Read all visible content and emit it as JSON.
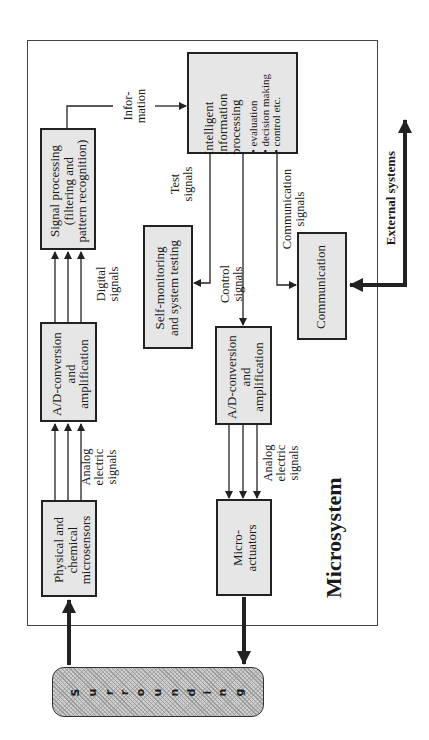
{
  "diagram": {
    "title": "Microsystem",
    "surrounding_label": "Surrounding",
    "surrounding_letters": [
      "S",
      "u",
      "r",
      "r",
      "o",
      "u",
      "n",
      "d",
      "i",
      "n",
      "g"
    ],
    "external_label": "External systems",
    "boxes": {
      "sensors": {
        "lines": [
          "Physical and",
          "chemical",
          "microsensors"
        ]
      },
      "ad_in": {
        "lines": [
          "A/D-conversion",
          "and",
          "amplification"
        ]
      },
      "signal_processing": {
        "lines": [
          "Signal processing",
          "(filtering and",
          "pattern recognition)"
        ]
      },
      "intelligent": {
        "lines": [
          "Intelligent",
          "information",
          "processing"
        ],
        "bullets": [
          "• evaluation",
          "• decision making",
          "• control etc."
        ]
      },
      "self_monitoring": {
        "lines": [
          "Self-monitoring",
          "and system testing"
        ]
      },
      "ad_out": {
        "lines": [
          "A/D-conversion",
          "and",
          "amplification"
        ]
      },
      "actuators": {
        "lines": [
          "Micro-",
          "actuators"
        ]
      },
      "communication": {
        "lines": [
          "Communication"
        ]
      }
    },
    "edge_labels": {
      "analog_in": [
        "Analog",
        "electric",
        "signals"
      ],
      "digital": [
        "Digital",
        "signals"
      ],
      "information": [
        "Infor-",
        "mation"
      ],
      "test": [
        "Test",
        "signals"
      ],
      "control": [
        "Control",
        "signals"
      ],
      "communication": [
        "Communication",
        "signals"
      ],
      "analog_out": [
        "Analog",
        "electric",
        "signals"
      ]
    },
    "colors": {
      "box_fill": "#e6e6e6",
      "stroke": "#222222",
      "frame": "#444444"
    }
  }
}
